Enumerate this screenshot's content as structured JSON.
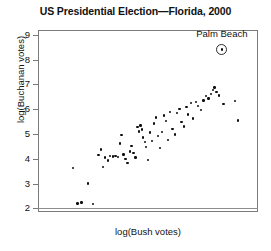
{
  "chart_data": {
    "type": "scatter",
    "title": "US Presidential Election—Florida, 2000",
    "xlabel": "log(Bush votes)",
    "ylabel": "log(Buchanan votes)",
    "grid": false,
    "legend": null,
    "xlim": [
      6.2,
      13.2
    ],
    "ylim": [
      1.85,
      9.2
    ],
    "x_ticks": [],
    "x_tick_labels": [],
    "y_ticks": [
      2,
      3,
      4,
      5,
      6,
      7,
      8,
      9
    ],
    "y_tick_labels": [
      "2",
      "3",
      "4",
      "5",
      "6",
      "7",
      "8",
      "9"
    ],
    "baseline_rule_y": 2,
    "annotations": [
      {
        "text": "Palm Beach",
        "x": 12.05,
        "y": 8.42,
        "marker": "circled-dot",
        "label_offset_y": 0.62
      }
    ],
    "series": [
      {
        "name": "Florida counties",
        "marker": "dot",
        "color": "#0d0d0d",
        "points": [
          [
            7.32,
            3.63
          ],
          [
            7.46,
            2.2
          ],
          [
            7.58,
            2.24
          ],
          [
            7.79,
            3.0
          ],
          [
            7.95,
            2.18
          ],
          [
            8.12,
            4.14
          ],
          [
            8.2,
            4.38
          ],
          [
            8.27,
            3.66
          ],
          [
            8.33,
            4.05
          ],
          [
            8.42,
            3.93
          ],
          [
            8.5,
            4.11
          ],
          [
            8.58,
            4.09
          ],
          [
            8.66,
            4.1
          ],
          [
            8.74,
            4.08
          ],
          [
            8.8,
            4.62
          ],
          [
            8.86,
            4.95
          ],
          [
            8.92,
            4.18
          ],
          [
            8.98,
            4.0
          ],
          [
            9.05,
            3.82
          ],
          [
            9.12,
            4.3
          ],
          [
            9.18,
            4.52
          ],
          [
            9.24,
            4.24
          ],
          [
            9.3,
            4.05
          ],
          [
            9.37,
            5.29
          ],
          [
            9.42,
            5.1
          ],
          [
            9.46,
            5.34
          ],
          [
            9.51,
            5.18
          ],
          [
            9.55,
            4.86
          ],
          [
            9.6,
            4.67
          ],
          [
            9.64,
            4.48
          ],
          [
            9.7,
            3.96
          ],
          [
            9.76,
            5.06
          ],
          [
            9.82,
            4.72
          ],
          [
            9.9,
            5.42
          ],
          [
            9.96,
            5.66
          ],
          [
            10.02,
            4.92
          ],
          [
            10.08,
            4.44
          ],
          [
            10.14,
            5.08
          ],
          [
            10.2,
            5.74
          ],
          [
            10.28,
            5.52
          ],
          [
            10.34,
            4.76
          ],
          [
            10.4,
            5.9
          ],
          [
            10.48,
            5.2
          ],
          [
            10.56,
            4.98
          ],
          [
            10.62,
            5.86
          ],
          [
            10.7,
            6.02
          ],
          [
            10.76,
            5.48
          ],
          [
            10.84,
            5.3
          ],
          [
            10.92,
            6.08
          ],
          [
            10.98,
            5.78
          ],
          [
            11.06,
            6.24
          ],
          [
            11.14,
            5.62
          ],
          [
            11.22,
            6.3
          ],
          [
            11.3,
            6.12
          ],
          [
            11.38,
            5.96
          ],
          [
            11.46,
            6.36
          ],
          [
            11.54,
            6.54
          ],
          [
            11.62,
            6.44
          ],
          [
            11.7,
            6.62
          ],
          [
            11.76,
            6.78
          ],
          [
            11.82,
            6.88
          ],
          [
            11.88,
            6.7
          ],
          [
            11.96,
            6.56
          ],
          [
            12.1,
            6.2
          ],
          [
            12.46,
            6.34
          ],
          [
            12.56,
            5.54
          ]
        ]
      }
    ]
  }
}
